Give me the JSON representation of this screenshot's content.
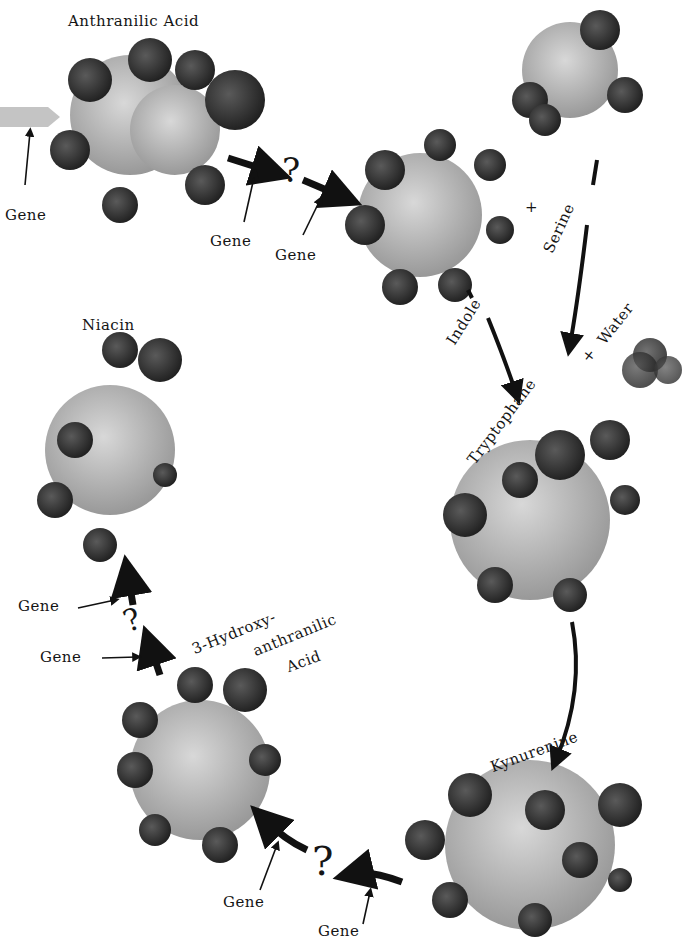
{
  "diagram": {
    "colors": {
      "background": "#ffffff",
      "atom_dark": "#3a3a3a",
      "atom_light": "#bdbdbd",
      "arrow": "#111111",
      "input_arrow": "#c4c4c4"
    },
    "molecules": {
      "anthranilic_acid": {
        "label": "Anthranilic Acid"
      },
      "indole": {
        "label": "Indole"
      },
      "serine": {
        "label": "Serine"
      },
      "water": {
        "label": "Water"
      },
      "tryptophane": {
        "label": "Tryptophane"
      },
      "kynurenine": {
        "label": "Kynurenine"
      },
      "hydroxy_anthranilic": {
        "label_line1": "3-Hydroxy-",
        "label_line2": "anthranilic",
        "label_line3": "Acid"
      },
      "niacin": {
        "label": "Niacin"
      }
    },
    "operators": {
      "plus1": "+",
      "plus2": "+"
    },
    "unknown_steps": {
      "q1": "?",
      "q2": "?",
      "q3": "?"
    },
    "gene_labels": {
      "g1": "Gene",
      "g2": "Gene",
      "g3": "Gene",
      "g4": "Gene",
      "g5": "Gene",
      "g6": "Gene",
      "g7": "Gene"
    }
  }
}
